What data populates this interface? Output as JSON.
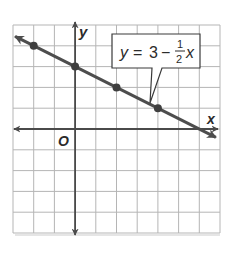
{
  "chart_data": {
    "type": "line",
    "title": "",
    "equation": {
      "lhs": "y",
      "equals": "=",
      "constant": "3",
      "minus": "−",
      "frac_num": "1",
      "frac_den": "2",
      "var": "x"
    },
    "xlabel": "x",
    "ylabel": "y",
    "origin_label": "O",
    "xlim": [
      -3,
      7
    ],
    "ylim": [
      -5,
      5
    ],
    "grid": true,
    "slope": -0.5,
    "intercept": 3,
    "points": [
      {
        "x": -2,
        "y": 4
      },
      {
        "x": 0,
        "y": 3
      },
      {
        "x": 2,
        "y": 2
      },
      {
        "x": 4,
        "y": 1
      }
    ],
    "line_extent": [
      {
        "x": -2.9,
        "y": 4.45
      },
      {
        "x": 6.8,
        "y": -0.4
      }
    ]
  },
  "colors": {
    "grid": "#b5b5b5",
    "axis": "#4a4a4a",
    "line": "#4d4d4d",
    "point": "#3f3f3f",
    "text": "#2b2b2b"
  }
}
